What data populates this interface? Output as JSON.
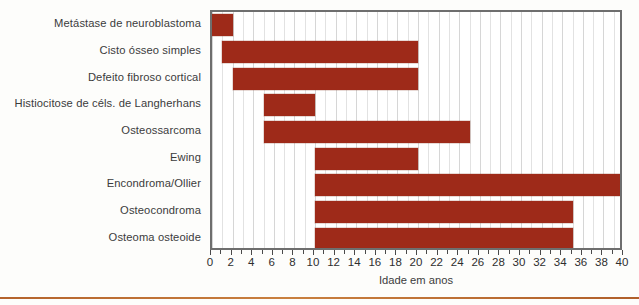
{
  "chart_data": {
    "type": "bar",
    "orientation": "horizontal",
    "subtype": "range",
    "title": "",
    "xlabel": "Idade em anos",
    "ylabel": "",
    "xlim": [
      0,
      40
    ],
    "xticks": [
      0,
      2,
      4,
      6,
      8,
      10,
      12,
      14,
      16,
      18,
      20,
      22,
      24,
      26,
      28,
      30,
      32,
      34,
      36,
      38,
      40
    ],
    "xtick_labels": [
      "0",
      "2",
      "4",
      "6",
      "8",
      "10",
      "12",
      "14",
      "16",
      "18",
      "20",
      "22",
      "24",
      "26",
      "28",
      "30",
      "32",
      "34",
      "36",
      "38",
      "40"
    ],
    "grid": true,
    "grid_axis": "x",
    "grid_step": 1,
    "legend": false,
    "bar_color": "#9E2A19",
    "frame_color": "#6E6E6E",
    "gridline_color": "#E2E2E2",
    "categories": [
      "Metástase de neuroblastoma",
      "Cisto ósseo simples",
      "Defeito fibroso cortical",
      "Histiocitose de céls. de Langherhans",
      "Osteossarcoma",
      "Ewing",
      "Encondroma/Ollier",
      "Osteocondroma",
      "Osteoma osteoide"
    ],
    "ranges": [
      {
        "label": "Metástase de neuroblastoma",
        "start": 0,
        "end": 2
      },
      {
        "label": "Cisto ósseo simples",
        "start": 1,
        "end": 20
      },
      {
        "label": "Defeito fibroso cortical",
        "start": 2,
        "end": 20
      },
      {
        "label": "Histiocitose de céls. de Langherhans",
        "start": 5,
        "end": 10
      },
      {
        "label": "Osteossarcoma",
        "start": 5,
        "end": 25
      },
      {
        "label": "Ewing",
        "start": 10,
        "end": 20
      },
      {
        "label": "Encondroma/Ollier",
        "start": 10,
        "end": 40
      },
      {
        "label": "Osteocondroma",
        "start": 10,
        "end": 35
      },
      {
        "label": "Osteoma osteoide",
        "start": 10,
        "end": 35
      }
    ],
    "values": [
      2,
      19,
      18,
      5,
      20,
      10,
      30,
      25,
      25
    ]
  }
}
